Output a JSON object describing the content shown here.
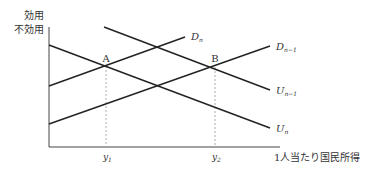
{
  "diagram": {
    "y_axis_label_line1": "効用",
    "y_axis_label_line2": "不効用",
    "x_axis_label": "1人当たり国民所得",
    "points": [
      {
        "label": "A"
      },
      {
        "label": "B"
      }
    ],
    "x_ticks": [
      {
        "label": "y",
        "sub": "1"
      },
      {
        "label": "y",
        "sub": "2"
      }
    ],
    "curves": [
      {
        "name": "D",
        "sub": "n"
      },
      {
        "name": "D",
        "sub": "n−1"
      },
      {
        "name": "U",
        "sub": "n−1"
      },
      {
        "name": "U",
        "sub": "n"
      }
    ],
    "colors": {
      "line": "#222222",
      "dashed": "#999999",
      "text": "#333333"
    }
  }
}
